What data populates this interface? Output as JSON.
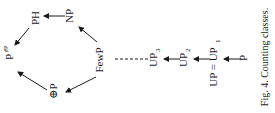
{
  "figure": {
    "caption": "Fig. 4. Counting classes.",
    "orientation": "rotated-90-ccw"
  },
  "nodes": {
    "ph": "PH",
    "np": "NP",
    "ppp": "P",
    "ppp_sup": "#P",
    "parity_p": "⊕P",
    "fewp": "FewP",
    "up3": "UP",
    "up3_sub": "3",
    "up2": "UP",
    "up2_sub": "2",
    "up_eq": "UP = UP",
    "up_eq_sub": "1",
    "p": "P"
  },
  "edges": [
    {
      "from": "NP",
      "to": "PH"
    },
    {
      "from": "PH",
      "to": "P^#P"
    },
    {
      "from": "⊕P",
      "to": "P^#P"
    },
    {
      "from": "FewP",
      "to": "NP"
    },
    {
      "from": "FewP",
      "to": "⊕P"
    },
    {
      "from": "UP_3",
      "to": "FewP",
      "style": "dashed"
    },
    {
      "from": "UP_2",
      "to": "UP_3"
    },
    {
      "from": "UP = UP_1",
      "to": "UP_2"
    },
    {
      "from": "P",
      "to": "UP = UP_1"
    }
  ]
}
